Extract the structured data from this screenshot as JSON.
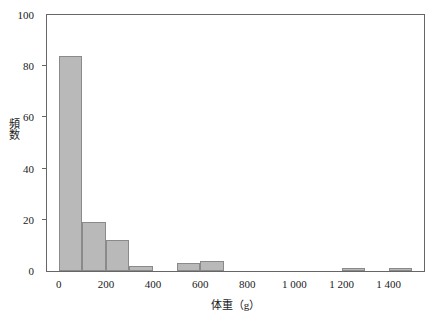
{
  "chart_data": {
    "type": "bar",
    "title": "",
    "subtitle": "",
    "xlabel": "体重（g）",
    "ylabel": "頻数",
    "xlim": [
      -50,
      1550
    ],
    "ylim": [
      0,
      100
    ],
    "grid": false,
    "legend": "none",
    "bin_width": 100,
    "x_tick_labels": [
      "0",
      "200",
      "400",
      "600",
      "800",
      "1 000",
      "1 200",
      "1 400"
    ],
    "x_tick_values": [
      0,
      200,
      400,
      600,
      800,
      1000,
      1200,
      1400
    ],
    "y_tick_labels": [
      "0",
      "20",
      "40",
      "60",
      "80",
      "100"
    ],
    "y_tick_values": [
      0,
      20,
      40,
      60,
      80,
      100
    ],
    "bar_color": "#b9b9b9",
    "bar_edge_color": "#8a8a8a",
    "axis_color": "#666666",
    "bins": [
      {
        "x0": 0,
        "x1": 100,
        "value": 84
      },
      {
        "x0": 100,
        "x1": 200,
        "value": 19
      },
      {
        "x0": 200,
        "x1": 300,
        "value": 12
      },
      {
        "x0": 300,
        "x1": 400,
        "value": 2
      },
      {
        "x0": 400,
        "x1": 500,
        "value": 0
      },
      {
        "x0": 500,
        "x1": 600,
        "value": 3
      },
      {
        "x0": 600,
        "x1": 700,
        "value": 4
      },
      {
        "x0": 700,
        "x1": 800,
        "value": 0
      },
      {
        "x0": 800,
        "x1": 900,
        "value": 0
      },
      {
        "x0": 900,
        "x1": 1000,
        "value": 0
      },
      {
        "x0": 1000,
        "x1": 1100,
        "value": 0
      },
      {
        "x0": 1100,
        "x1": 1200,
        "value": 0
      },
      {
        "x0": 1200,
        "x1": 1300,
        "value": 1
      },
      {
        "x0": 1300,
        "x1": 1400,
        "value": 0
      },
      {
        "x0": 1400,
        "x1": 1500,
        "value": 1
      }
    ],
    "categories": [
      "0-100",
      "100-200",
      "200-300",
      "300-400",
      "400-500",
      "500-600",
      "600-700",
      "700-800",
      "800-900",
      "900-1000",
      "1000-1100",
      "1100-1200",
      "1200-1300",
      "1300-1400",
      "1400-1500"
    ],
    "values": [
      84,
      19,
      12,
      2,
      0,
      3,
      4,
      0,
      0,
      0,
      0,
      0,
      1,
      0,
      1
    ]
  }
}
